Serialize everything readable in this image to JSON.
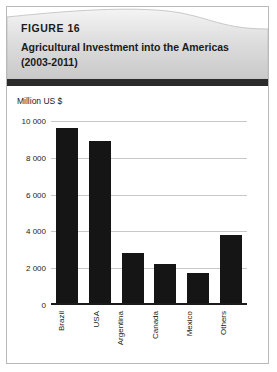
{
  "figure": {
    "number_label": "FIGURE 16",
    "title": "Agricultural Investment into the Americas (2003-2011)"
  },
  "chart_data": {
    "type": "bar",
    "title": "Agricultural Investment into the Americas (2003-2011)",
    "ylabel": "Million US $",
    "xlabel": "",
    "categories": [
      "Brazil",
      "USA",
      "Argentina",
      "Canada",
      "Mexico",
      "Others"
    ],
    "values": [
      9600,
      8900,
      2800,
      2250,
      1750,
      3800
    ],
    "ylim": [
      0,
      10000
    ],
    "ytick_labels": [
      "10 000",
      "8 000",
      "6 000",
      "4 000",
      "2 000",
      "0"
    ],
    "ytick_values": [
      10000,
      8000,
      6000,
      4000,
      2000,
      0
    ],
    "grid": true,
    "legend": "none",
    "bar_color": "#151515",
    "gridline_color": "#c8c8c8"
  }
}
